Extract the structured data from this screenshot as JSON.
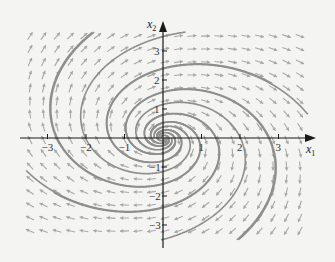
{
  "figure": {
    "type": "phase-portrait",
    "axes": {
      "x_label": "x",
      "x_label_sub": "1",
      "y_label": "x",
      "y_label_sub": "2",
      "x_ticks": [
        {
          "value": -3,
          "label": "−3"
        },
        {
          "value": -2,
          "label": "−2"
        },
        {
          "value": -1,
          "label": "−1"
        },
        {
          "value": 1,
          "label": "1"
        },
        {
          "value": 2,
          "label": "2"
        },
        {
          "value": 3,
          "label": "3"
        }
      ],
      "y_ticks": [
        {
          "value": 3,
          "label": "3"
        },
        {
          "value": 2,
          "label": "2"
        },
        {
          "value": 1,
          "label": "1"
        },
        {
          "value": -1,
          "label": "−1"
        },
        {
          "value": -2,
          "label": "−2"
        },
        {
          "value": -3,
          "label": "−3"
        }
      ],
      "x_range": [
        -3.9,
        3.9
      ],
      "y_range": [
        -3.6,
        3.6
      ]
    },
    "colors": {
      "background": "#f4f4f2",
      "axis": "#1a1a1a",
      "field_arrows": "#a8a8a8",
      "trajectories": "#8e8e8e"
    },
    "system": {
      "dx1": "0.35*x1 + 1.0*x2",
      "dx2": "-1.0*x1 + 0.35*x2",
      "a11": 0.35,
      "a12": 1.0,
      "a21": -1.0,
      "a22": 0.35
    },
    "trajectory_starts": [
      [
        0.05,
        0.0
      ],
      [
        0.1,
        0.0
      ],
      [
        0.15,
        0.0
      ],
      [
        0.22,
        0.0
      ],
      [
        0.3,
        0.0
      ],
      [
        -0.05,
        0.0
      ],
      [
        -0.1,
        0.0
      ],
      [
        -0.15,
        0.0
      ],
      [
        -0.22,
        0.0
      ],
      [
        -0.3,
        0.0
      ]
    ]
  }
}
